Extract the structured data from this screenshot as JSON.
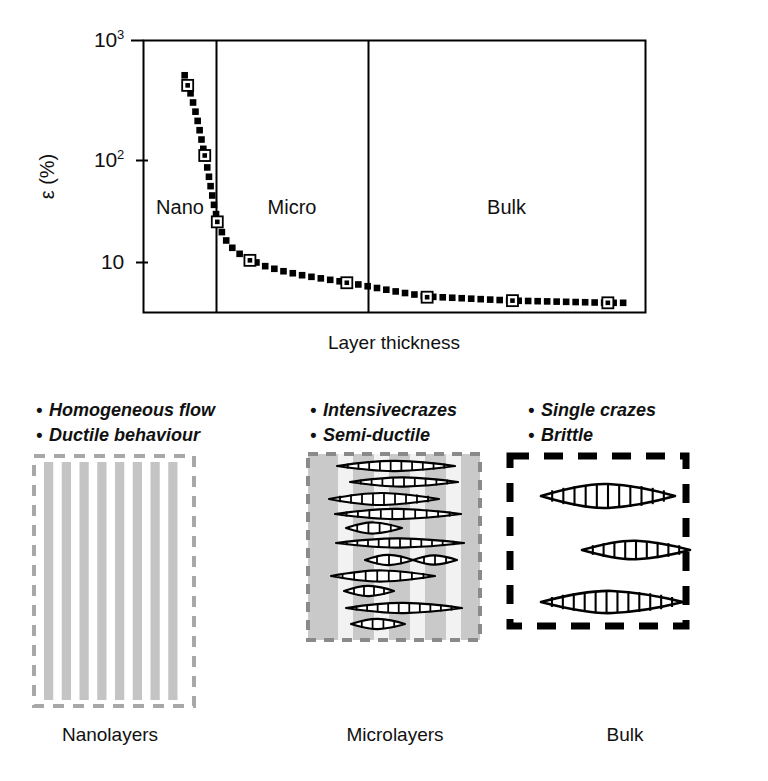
{
  "figure": {
    "type": "scientific-schematic",
    "background": "#ffffff"
  },
  "chart_data": {
    "type": "line",
    "title": "",
    "subtitle": "",
    "xlabel": "Layer thickness",
    "ylabel": "ε (%)",
    "x_axis": {
      "label": "Layer thickness",
      "scale": "linear-qualitative",
      "tick_labels": [],
      "range_note": "qualitative: increasing layer thickness left to right"
    },
    "y_axis": {
      "label": "ε (%)",
      "scale": "log10",
      "tick_values": [
        10,
        100,
        1000
      ],
      "tick_labels": [
        "10",
        "10²",
        "10³"
      ],
      "ylim": [
        6,
        1000
      ],
      "grid": false
    },
    "regions": [
      {
        "name": "Nano",
        "label": "Nano",
        "x_start": 0.0,
        "x_end": 0.145
      },
      {
        "name": "Micro",
        "label": "Micro",
        "x_start": 0.145,
        "x_end": 0.448
      },
      {
        "name": "Bulk",
        "label": "Bulk",
        "x_start": 0.448,
        "x_end": 1.0
      }
    ],
    "series": [
      {
        "name": "Strain at break vs layer thickness",
        "marker": "open-square-with-dot",
        "line_style": "dotted",
        "points": [
          {
            "x": 0.088,
            "y": 430,
            "region": "Nano"
          },
          {
            "x": 0.122,
            "y": 115,
            "region": "Nano"
          },
          {
            "x": 0.147,
            "y": 33,
            "region": "Nano"
          },
          {
            "x": 0.212,
            "y": 16,
            "region": "Micro"
          },
          {
            "x": 0.405,
            "y": 10.5,
            "region": "Micro"
          },
          {
            "x": 0.565,
            "y": 8.0,
            "region": "Bulk"
          },
          {
            "x": 0.735,
            "y": 7.5,
            "region": "Bulk"
          },
          {
            "x": 0.925,
            "y": 7.2,
            "region": "Bulk"
          }
        ],
        "curve": [
          {
            "x": 0.082,
            "y": 520
          },
          {
            "x": 0.09,
            "y": 420
          },
          {
            "x": 0.098,
            "y": 320
          },
          {
            "x": 0.106,
            "y": 240
          },
          {
            "x": 0.113,
            "y": 175
          },
          {
            "x": 0.12,
            "y": 125
          },
          {
            "x": 0.128,
            "y": 88
          },
          {
            "x": 0.135,
            "y": 60
          },
          {
            "x": 0.142,
            "y": 42
          },
          {
            "x": 0.15,
            "y": 31
          },
          {
            "x": 0.162,
            "y": 24
          },
          {
            "x": 0.178,
            "y": 20
          },
          {
            "x": 0.196,
            "y": 17.5
          },
          {
            "x": 0.215,
            "y": 16
          },
          {
            "x": 0.245,
            "y": 14.2
          },
          {
            "x": 0.28,
            "y": 13.0
          },
          {
            "x": 0.32,
            "y": 12.0
          },
          {
            "x": 0.365,
            "y": 11.2
          },
          {
            "x": 0.41,
            "y": 10.5
          },
          {
            "x": 0.46,
            "y": 9.6
          },
          {
            "x": 0.51,
            "y": 8.8
          },
          {
            "x": 0.565,
            "y": 8.1
          },
          {
            "x": 0.62,
            "y": 7.9
          },
          {
            "x": 0.675,
            "y": 7.7
          },
          {
            "x": 0.735,
            "y": 7.5
          },
          {
            "x": 0.8,
            "y": 7.4
          },
          {
            "x": 0.865,
            "y": 7.3
          },
          {
            "x": 0.925,
            "y": 7.2
          },
          {
            "x": 0.965,
            "y": 7.2
          }
        ]
      }
    ]
  },
  "chart": {
    "y_tick_10": "10",
    "y_tick_100_base": "10",
    "y_tick_100_exp": "2",
    "y_tick_1000_base": "10",
    "y_tick_1000_exp": "3",
    "y_title": "ε (%)",
    "x_title": "Layer thickness",
    "region_nano": "Nano",
    "region_micro": "Micro",
    "region_bulk": "Bulk"
  },
  "panels": [
    {
      "id": "nanolayers",
      "caption": "Nanolayers",
      "bullets": [
        "Homogeneous flow",
        "Ductile behaviour"
      ],
      "bullet_marker": "•",
      "art": {
        "kind": "vertical-layer-stack",
        "border_style": "dashed",
        "border_color": "#a8a8a8",
        "stripe_color": "#c4c4c4",
        "stripe_count": 8,
        "crazes": 0
      }
    },
    {
      "id": "microlayers",
      "caption": "Microlayers",
      "bullets": [
        "Intensivecrazes",
        "Semi-ductile"
      ],
      "bullet_marker": "•",
      "art": {
        "kind": "layered-with-crazes",
        "border_style": "dashed",
        "border_color": "#8a8a8a",
        "background_color": "#c9c9c9",
        "stripe_color": "#f2f2f2",
        "stripe_count": 4,
        "crazes": 12,
        "craze_style": "lens-with-fibrils"
      }
    },
    {
      "id": "bulk",
      "caption": "Bulk",
      "bullets": [
        "Single crazes",
        "Brittle"
      ],
      "bullet_marker": "•",
      "art": {
        "kind": "bulk-with-crazes",
        "border_style": "dashed",
        "border_color": "#000000",
        "background_color": "#ffffff",
        "crazes": 3,
        "craze_style": "lens-with-fibrils"
      }
    }
  ]
}
